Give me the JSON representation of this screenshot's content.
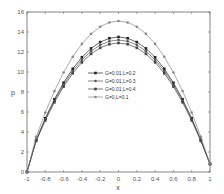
{
  "chart_data": {
    "type": "line",
    "title": "",
    "xlabel": "x",
    "ylabel": "p",
    "xlim": [
      -1,
      1
    ],
    "ylim": [
      0,
      16
    ],
    "xticks": [
      "-1",
      "-0.8",
      "-0.6",
      "-0.4",
      "-0.2",
      "0",
      "0.2",
      "0.4",
      "0.6",
      "0.8",
      "1"
    ],
    "yticks": [
      "0",
      "2",
      "4",
      "6",
      "8",
      "10",
      "12",
      "14",
      "16"
    ],
    "grid": false,
    "legend_position": "center",
    "series": [
      {
        "name": "G=0.01,L=0.2",
        "color": "#222222",
        "marker": "square",
        "peak": 13.5,
        "end_value": 0.8
      },
      {
        "name": "G=0.01,L=0.3",
        "color": "#555555",
        "marker": "circle",
        "peak": 13.2,
        "end_value": 0.8
      },
      {
        "name": "G=0.01,L=0.4",
        "color": "#444444",
        "marker": "square",
        "peak": 12.9,
        "end_value": 0.8
      },
      {
        "name": "G=0,L=0.1",
        "color": "#888888",
        "marker": "circle",
        "peak": 15.1,
        "end_value": 0.8
      }
    ],
    "x": [
      -1,
      -0.9,
      -0.8,
      -0.7,
      -0.6,
      -0.5,
      -0.4,
      -0.3,
      -0.2,
      -0.1,
      0,
      0.1,
      0.2,
      0.3,
      0.4,
      0.5,
      0.6,
      0.7,
      0.8,
      0.9,
      1
    ]
  }
}
